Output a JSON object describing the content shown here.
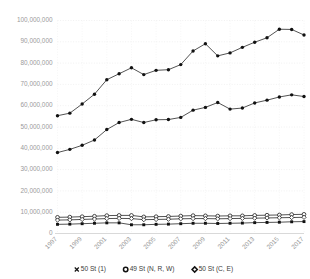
{
  "chart_data": {
    "type": "line",
    "title": "",
    "subtitle": "",
    "xlabel": "",
    "ylabel": "",
    "grid": true,
    "grid_style": "dotted",
    "legend_position": "bottom",
    "ylim": [
      0,
      100000000
    ],
    "ytick_values": [
      0,
      10000000,
      20000000,
      30000000,
      40000000,
      50000000,
      60000000,
      70000000,
      80000000,
      90000000,
      100000000
    ],
    "ytick_labels": [
      "0",
      "10,000,000",
      "20,000,000",
      "30,000,000",
      "40,000,000",
      "50,000,000",
      "60,000,000",
      "70,000,000",
      "80,000,000",
      "90,000,000",
      "100,000,000"
    ],
    "x": [
      1997,
      1998,
      1999,
      2000,
      2001,
      2002,
      2003,
      2004,
      2005,
      2006,
      2007,
      2008,
      2009,
      2010,
      2011,
      2012,
      2013,
      2014,
      2015,
      2016,
      2017
    ],
    "xtick_values": [
      1997,
      1999,
      2001,
      2003,
      2005,
      2007,
      2009,
      2011,
      2013,
      2015,
      2017
    ],
    "xtick_labels": [
      "1997",
      "1999",
      "2001",
      "2003",
      "2005",
      "2007",
      "2009",
      "2011",
      "2013",
      "2015",
      "2017"
    ],
    "xtick_rotation": 45,
    "series": [
      {
        "name": "50 St  (C, E)",
        "marker": "open-diamond",
        "values": [
          55300000,
          56500000,
          60800000,
          65400000,
          72200000,
          75000000,
          77800000,
          74600000,
          76600000,
          76900000,
          79300000,
          85700000,
          89100000,
          83400000,
          84800000,
          87400000,
          89800000,
          91900000,
          95900000,
          95800000,
          93200000
        ]
      },
      {
        "name": "49 St  (N, R, W)",
        "marker": "open-circle",
        "values": [
          38000000,
          39500000,
          41400000,
          43900000,
          48800000,
          52100000,
          53600000,
          52100000,
          53400000,
          53500000,
          54500000,
          57900000,
          59200000,
          61500000,
          58400000,
          58900000,
          61300000,
          62600000,
          64100000,
          65100000,
          64300000
        ]
      },
      {
        "name": "50 St  (1) upper",
        "marker": "open-circle",
        "values": [
          7600000,
          7700000,
          7900000,
          8100000,
          8400000,
          8500000,
          8500000,
          7800000,
          7900000,
          8000000,
          8200000,
          8400000,
          8300000,
          8200000,
          8300000,
          8300000,
          8500000,
          8600000,
          8700000,
          8900000,
          9000000
        ]
      },
      {
        "name": "50 St  (1) middle",
        "marker": "open-diamond",
        "values": [
          6300000,
          6400000,
          6600000,
          6800000,
          7000000,
          7100000,
          7000000,
          6500000,
          6600000,
          6700000,
          6900000,
          7000000,
          7000000,
          6900000,
          7000000,
          7100000,
          7200000,
          7300000,
          7400000,
          7500000,
          7600000
        ]
      },
      {
        "name": "50 St  (1)",
        "marker": "filled-cross",
        "values": [
          4300000,
          4400000,
          4600000,
          4800000,
          5000000,
          5000000,
          4100000,
          4100000,
          4300000,
          4400000,
          4600000,
          4800000,
          4800000,
          4700000,
          4800000,
          4900000,
          5100000,
          5200000,
          5300000,
          5500000,
          5600000
        ]
      }
    ],
    "legend": [
      {
        "label": "50 St  (1)",
        "marker": "filled-cross"
      },
      {
        "label": "49 St  (N, R, W)",
        "marker": "open-circle"
      },
      {
        "label": "50 St  (C, E)",
        "marker": "open-diamond"
      }
    ],
    "colors": {
      "line": "#1a1a1a",
      "marker_fill": "#111111",
      "marker_open_fill": "#ffffff",
      "grid": "#e3e3e3",
      "axis": "#c8c8c8",
      "tick_text": "#9a9a9a",
      "legend_text": "#3b3b3b",
      "background": "#ffffff"
    }
  }
}
